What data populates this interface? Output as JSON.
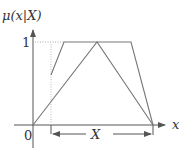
{
  "diagram": {
    "y_axis_label": "μ(x|X)",
    "x_axis_label": "x",
    "origin_label": "0",
    "one_label": "1",
    "interval_label": "X"
  },
  "colors": {
    "line": "#777777",
    "axis": "#555555",
    "dotted": "#aaaaaa",
    "text": "#333333"
  },
  "shapes": {
    "trapezoid": "membership function trapezoid over interval X",
    "triangle": "triangular membership function from 0 to end of X"
  }
}
